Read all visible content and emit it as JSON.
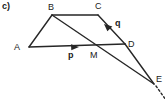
{
  "figure": {
    "part_label": "c)",
    "stroke_color": "#262626",
    "text_color": "#1a1a1a",
    "background_color": "#ffffff",
    "width": 165,
    "height": 102
  },
  "points": {
    "A": {
      "label": "A",
      "x": 29,
      "y": 47,
      "label_x": 14,
      "label_y": 43
    },
    "B": {
      "label": "B",
      "x": 52,
      "y": 15,
      "label_x": 48,
      "label_y": 3
    },
    "C": {
      "label": "C",
      "x": 98,
      "y": 15,
      "label_x": 95,
      "label_y": 2
    },
    "D": {
      "label": "D",
      "x": 125,
      "y": 44,
      "label_x": 128,
      "label_y": 40
    },
    "M": {
      "label": "M",
      "x": 100,
      "y": 47,
      "label_x": 90,
      "label_y": 51
    },
    "E": {
      "label": "E",
      "x": 154,
      "y": 84,
      "label_x": 156,
      "label_y": 75
    }
  },
  "vectors": {
    "p": {
      "label": "p",
      "label_x": 68,
      "label_y": 51,
      "from": "A",
      "to": "D",
      "arrow_x": 78,
      "arrow_y": 47
    },
    "q": {
      "label": "q",
      "label_x": 115,
      "label_y": 19,
      "from": "D",
      "to": "C",
      "arrow_x": 106,
      "arrow_y": 27
    }
  },
  "segments": [
    {
      "name": "segment-AB",
      "from": "A",
      "to": "B"
    },
    {
      "name": "segment-BC",
      "from": "B",
      "to": "C"
    },
    {
      "name": "segment-CD",
      "from": "C",
      "to": "D"
    },
    {
      "name": "segment-AD",
      "from": "A",
      "to": "D"
    },
    {
      "name": "segment-BE",
      "from": "B",
      "to": "E"
    },
    {
      "name": "segment-DE",
      "from": "D",
      "to": "E"
    }
  ],
  "dashed_extension": {
    "name": "dashed-extension-beyond-E",
    "from_x": 155,
    "from_y": 85,
    "to_x": 165,
    "to_y": 99
  }
}
